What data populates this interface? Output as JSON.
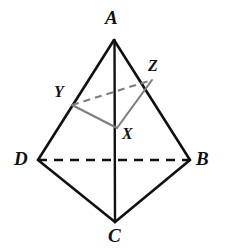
{
  "figure": {
    "kind": "geometry-diagram",
    "background_color": "#ffffff",
    "stroke_color": "#111111",
    "inner_stroke_color": "#7d7d7d",
    "outer_stroke_width": 2.6,
    "inner_stroke_width": 2.0,
    "points": {
      "A": {
        "label": "A",
        "x": 114,
        "y": 40,
        "label_x": 105,
        "label_y": 8
      },
      "B": {
        "label": "B",
        "x": 190,
        "y": 160,
        "label_x": 196,
        "label_y": 149
      },
      "C": {
        "label": "C",
        "x": 115,
        "y": 222,
        "label_x": 108,
        "label_y": 226
      },
      "D": {
        "label": "D",
        "x": 38,
        "y": 160,
        "label_x": 14,
        "label_y": 149
      },
      "X": {
        "label": "X",
        "x": 117,
        "y": 128,
        "label_x": 122,
        "label_y": 126
      },
      "Y": {
        "label": "Y",
        "x": 72,
        "y": 105,
        "label_x": 54,
        "label_y": 84
      },
      "Z": {
        "label": "Z",
        "x": 152,
        "y": 80,
        "label_x": 148,
        "label_y": 58
      }
    },
    "edges": [
      {
        "name": "edge-AD",
        "from": "A",
        "to": "D",
        "style": "solid",
        "color": "outer"
      },
      {
        "name": "edge-AB",
        "from": "A",
        "to": "B",
        "style": "solid",
        "color": "outer"
      },
      {
        "name": "edge-DC",
        "from": "D",
        "to": "C",
        "style": "solid",
        "color": "outer"
      },
      {
        "name": "edge-BC",
        "from": "B",
        "to": "C",
        "style": "solid",
        "color": "outer"
      },
      {
        "name": "edge-AC",
        "from": "A",
        "to": "C",
        "style": "solid",
        "color": "outer"
      },
      {
        "name": "edge-DB",
        "from": "D",
        "to": "B",
        "style": "dashed",
        "color": "outer"
      },
      {
        "name": "edge-XY",
        "from": "X",
        "to": "Y",
        "style": "solid",
        "color": "inner"
      },
      {
        "name": "edge-XZ",
        "from": "X",
        "to": "Z",
        "style": "solid",
        "color": "inner"
      },
      {
        "name": "edge-YZ",
        "from": "Y",
        "to": "Z",
        "style": "dashed",
        "color": "inner"
      }
    ],
    "dash_pattern_outer": "9 7",
    "dash_pattern_inner": "7 5"
  }
}
